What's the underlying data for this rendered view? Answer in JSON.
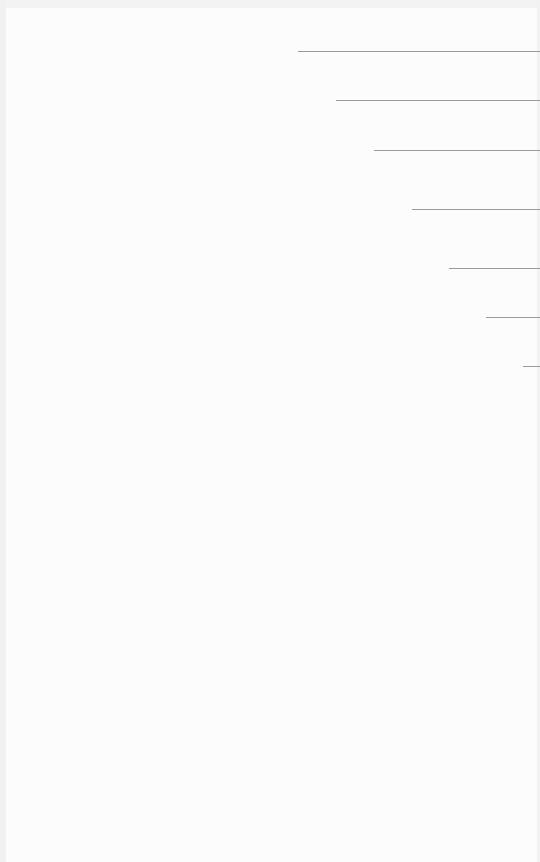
{
  "canvas": {
    "background": "#fcfcfc",
    "line_color": "#9a9a9a"
  },
  "lines": [
    {
      "y": 51,
      "x_start": 298,
      "x_end": 540
    },
    {
      "y": 100,
      "x_start": 336,
      "x_end": 540
    },
    {
      "y": 150,
      "x_start": 374,
      "x_end": 540
    },
    {
      "y": 209,
      "x_start": 412,
      "x_end": 540
    },
    {
      "y": 268,
      "x_start": 449,
      "x_end": 540
    },
    {
      "y": 317,
      "x_start": 486,
      "x_end": 540
    },
    {
      "y": 366,
      "x_start": 523,
      "x_end": 540
    }
  ]
}
